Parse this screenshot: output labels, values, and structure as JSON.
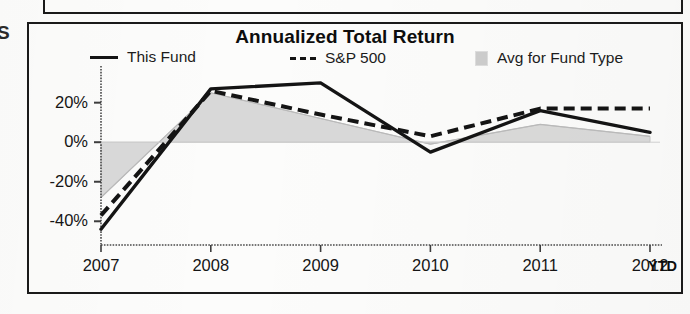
{
  "document": {
    "margin_glyph": "S"
  },
  "chart": {
    "title": "Annualized Total Return",
    "x_axis_note": "YTD",
    "legend": [
      {
        "key": "this_fund",
        "label": "This Fund",
        "marker": "solid-line-swatch",
        "color": "#141414"
      },
      {
        "key": "sp500",
        "label": "S&P 500",
        "marker": "dashed-line-swatch",
        "color": "#141414",
        "prefix": "---"
      },
      {
        "key": "avg_fund_type",
        "label": "Avg for Fund Type",
        "marker": "area-swatch",
        "color": "#cbcbcb"
      }
    ]
  },
  "chart_data": {
    "type": "line",
    "title": "Annualized Total Return",
    "xlabel": "",
    "ylabel": "",
    "categories": [
      "2007",
      "2008",
      "2009",
      "2010",
      "2011",
      "2012"
    ],
    "x_tick_labels": [
      "2007",
      "2008",
      "2009",
      "2010",
      "2011",
      "2012"
    ],
    "x_axis_suffix": "YTD",
    "y_tick_labels": [
      "20%",
      "0%",
      "-20%",
      "-40%"
    ],
    "y_ticks": [
      20,
      0,
      -20,
      -40
    ],
    "ylim": [
      -52,
      34
    ],
    "grid": false,
    "legend_position": "top",
    "series": [
      {
        "name": "This Fund",
        "style": "solid",
        "color": "#141414",
        "values": [
          -44,
          27,
          30,
          -5,
          16,
          5
        ]
      },
      {
        "name": "S&P 500",
        "style": "dashed",
        "color": "#141414",
        "values": [
          -37,
          26,
          14,
          3,
          17,
          17
        ]
      },
      {
        "name": "Avg for Fund Type",
        "style": "filled-area",
        "color": "#cbcbcb",
        "values": [
          -28,
          25,
          12,
          -1,
          9,
          3
        ]
      }
    ]
  }
}
